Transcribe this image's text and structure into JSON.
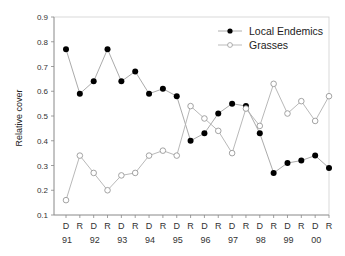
{
  "chart_data": {
    "type": "line",
    "title": "",
    "xlabel": "",
    "ylabel": "Relative cover",
    "ylim": [
      0.1,
      0.9
    ],
    "yticks": [
      0.1,
      0.2,
      0.3,
      0.4,
      0.5,
      0.6,
      0.7,
      0.8,
      0.9
    ],
    "grid": false,
    "legend_position": "upper right",
    "categories": [
      "D",
      "R",
      "D",
      "R",
      "D",
      "R",
      "D",
      "R",
      "D",
      "R",
      "D",
      "R",
      "D",
      "R",
      "D",
      "R",
      "D",
      "R",
      "D",
      "R"
    ],
    "year_labels": [
      "91",
      "92",
      "93",
      "94",
      "95",
      "96",
      "97",
      "98",
      "99",
      "00"
    ],
    "series": [
      {
        "name": "Local Endemics",
        "marker": "filled-circle",
        "color": "#000000",
        "values": [
          0.77,
          0.59,
          0.64,
          0.77,
          0.64,
          0.68,
          0.59,
          0.61,
          0.58,
          0.4,
          0.43,
          0.51,
          0.55,
          0.54,
          0.43,
          0.27,
          0.31,
          0.32,
          0.34,
          0.29
        ]
      },
      {
        "name": "Grasses",
        "marker": "open-circle",
        "color": "#888888",
        "values": [
          0.16,
          0.34,
          0.27,
          0.2,
          0.26,
          0.27,
          0.34,
          0.36,
          0.34,
          0.54,
          0.49,
          0.44,
          0.35,
          0.53,
          0.46,
          0.63,
          0.51,
          0.56,
          0.48,
          0.58
        ]
      }
    ]
  },
  "legend": {
    "items": [
      {
        "label": "Local Endemics"
      },
      {
        "label": "Grasses"
      }
    ]
  },
  "axis": {
    "ylabel": "Relative cover"
  }
}
